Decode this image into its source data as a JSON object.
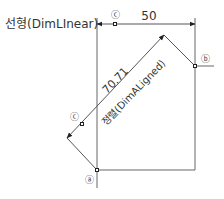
{
  "diagram": {
    "linear_label": "선형(DimLInear)",
    "linear_value": "50",
    "aligned_value": "70.71",
    "aligned_label": "정렬(DimALigned)",
    "point_a": "ⓐ",
    "point_b": "ⓑ",
    "point_c_top": "ⓒ",
    "point_c_left": "ⓒ",
    "colors": {
      "line": "#555555",
      "text": "#333333",
      "point": "#222222"
    }
  }
}
